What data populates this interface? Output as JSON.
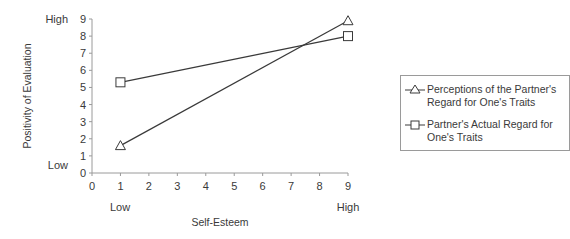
{
  "chart_data": {
    "type": "line",
    "title": "",
    "xlabel": "Self-Esteem",
    "ylabel": "Positivity of Evaluation",
    "x_ticks": [
      0,
      1,
      2,
      3,
      4,
      5,
      6,
      7,
      8,
      9
    ],
    "y_ticks": [
      0,
      1,
      2,
      3,
      4,
      5,
      6,
      7,
      8,
      9
    ],
    "xlim": [
      0,
      9
    ],
    "ylim": [
      0,
      9
    ],
    "x_annotations": [
      {
        "x": 1,
        "label": "Low"
      },
      {
        "x": 9,
        "label": "High"
      }
    ],
    "y_annotations": [
      {
        "y": 0,
        "label": "Low"
      },
      {
        "y": 9,
        "label": "High"
      }
    ],
    "grid": false,
    "legend_position": "right-inside",
    "x": [
      1,
      9
    ],
    "series": [
      {
        "name": "Perceptions of the Partner's Regard for One's Traits",
        "marker": "triangle",
        "values": [
          1.6,
          8.9
        ]
      },
      {
        "name": "Partner's Actual Regard for One's Traits",
        "marker": "square",
        "values": [
          5.3,
          8.0
        ]
      }
    ]
  },
  "legend": {
    "items": [
      {
        "line1": "Perceptions of the Partner's",
        "line2": "Regard for One's Traits"
      },
      {
        "line1": "Partner's Actual Regard for",
        "line2": "One's Traits"
      }
    ]
  },
  "axes": {
    "x_title": "Self-Esteem",
    "y_title": "Positivity of Evaluation",
    "x_low": "Low",
    "x_high": "High",
    "y_low": "Low",
    "y_high": "High"
  }
}
